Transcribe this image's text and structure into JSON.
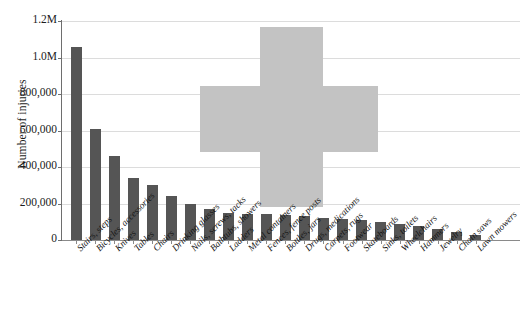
{
  "chart_data": {
    "type": "bar",
    "title": "",
    "xlabel": "",
    "ylabel": "Number of injuries",
    "ylim": [
      0,
      1200000
    ],
    "grid": true,
    "legend": "none",
    "orientation": "vertical",
    "bar_color": "#555555",
    "watermark": {
      "shape": "plus-cross",
      "color": "#c3c3c3"
    },
    "ytick_labels": [
      "1.2M",
      "1.0M",
      "800,000",
      "600,000",
      "400,000",
      "200,000",
      "0"
    ],
    "ytick_values": [
      1200000,
      1000000,
      800000,
      600000,
      400000,
      200000,
      0
    ],
    "categories": [
      "Stairs, steps",
      "Bicycles, accessories",
      "Knives",
      "Tables",
      "Chairs",
      "Drinking glasses",
      "Nails, screws, tacks",
      "Bathtubs, showers",
      "Ladders",
      "Metal containers",
      "Fences, fence posts",
      "Bottles, jars",
      "Drugs, medications",
      "Carpets, rugs",
      "Footwear",
      "Skateboards",
      "Sinks, toilets",
      "Wheelchairs",
      "Hammers",
      "Jewelry",
      "Chain saws",
      "Lawn mowers"
    ],
    "values": [
      1060000,
      610000,
      460000,
      340000,
      300000,
      240000,
      195000,
      170000,
      150000,
      145000,
      140000,
      135000,
      130000,
      120000,
      115000,
      110000,
      100000,
      90000,
      75000,
      60000,
      45000,
      30000
    ]
  }
}
